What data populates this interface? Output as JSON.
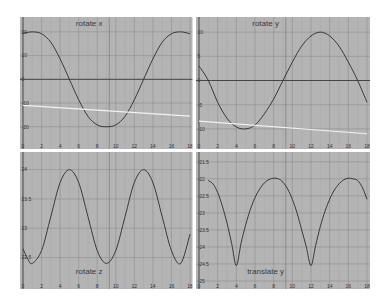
{
  "colors": {
    "panel_bg": "#b4b4b4",
    "grid_major": "#8f8f8f",
    "grid_minor": "#a6a6a6",
    "zero_line": "#3c3c3c",
    "curve": "#2b2b2b",
    "reference_line": "#f2f2f2",
    "divider": "#ffffff"
  },
  "chart_data": [
    {
      "type": "line",
      "title": "rotate x",
      "xlabel": "",
      "ylabel": "",
      "xlim": [
        0,
        18
      ],
      "ylim": [
        -26,
        25
      ],
      "xticks": [
        0,
        2,
        4,
        6,
        8,
        10,
        12,
        14,
        16,
        18
      ],
      "xtick_labels": [
        "0",
        "2",
        "4",
        "6",
        "8",
        "10",
        "12",
        "14",
        "16",
        "18"
      ],
      "yticks": [
        20,
        10,
        0,
        -10,
        -20
      ],
      "ytick_labels": [
        "20",
        "10",
        "0",
        "-10",
        "-20"
      ],
      "grid": true,
      "title_position": "top-center",
      "series": [
        {
          "name": "rotate x curve",
          "x": [
            0,
            1,
            2,
            3,
            4,
            5,
            6,
            7,
            8,
            9,
            10,
            11,
            12,
            13,
            14,
            15,
            16,
            17,
            18
          ],
          "y": [
            19.4,
            20,
            19.2,
            15.6,
            8.6,
            0,
            -8.6,
            -15.6,
            -19.2,
            -20,
            -19.2,
            -15.6,
            -8.6,
            0,
            8.6,
            15.6,
            19.2,
            20,
            19.2
          ]
        },
        {
          "name": "reference line",
          "x": [
            0,
            18
          ],
          "y": [
            -11,
            -15.5
          ]
        }
      ],
      "horizontal_lines": [
        0
      ]
    },
    {
      "type": "line",
      "title": "rotate y",
      "xlabel": "",
      "ylabel": "",
      "xlim": [
        0,
        18
      ],
      "ylim": [
        -12.5,
        12.5
      ],
      "xticks": [
        0,
        2,
        4,
        6,
        8,
        10,
        12,
        14,
        16,
        18
      ],
      "xtick_labels": [
        "0",
        "2",
        "4",
        "6",
        "8",
        "10",
        "12",
        "14",
        "16",
        "18"
      ],
      "yticks": [
        10,
        5,
        0,
        -5,
        -10
      ],
      "ytick_labels": [
        "10",
        "5",
        "0",
        "-5",
        "-10"
      ],
      "grid": true,
      "title_position": "top-center",
      "series": [
        {
          "name": "rotate y curve",
          "x": [
            0,
            1,
            2,
            3,
            4,
            5,
            6,
            7,
            8,
            9,
            10,
            11,
            12,
            13,
            14,
            15,
            16,
            17,
            18
          ],
          "y": [
            3,
            0,
            -4.5,
            -7.8,
            -9.6,
            -10,
            -9.2,
            -6.9,
            -3.8,
            0,
            3.8,
            7.1,
            9.2,
            10,
            9.2,
            7.1,
            3.8,
            0,
            -4.5
          ]
        },
        {
          "name": "reference line",
          "x": [
            0,
            18
          ],
          "y": [
            -8.4,
            -11
          ]
        }
      ],
      "horizontal_lines": [
        0
      ]
    },
    {
      "type": "line",
      "title": "rotate z",
      "xlabel": "",
      "ylabel": "",
      "xlim": [
        0,
        18
      ],
      "ylim": [
        22.1,
        24.25
      ],
      "xticks": [
        0,
        2,
        4,
        6,
        8,
        10,
        12,
        14,
        16,
        18
      ],
      "xtick_labels": [
        "0",
        "2",
        "4",
        "6",
        "8",
        "10",
        "12",
        "14",
        "16",
        "18"
      ],
      "yticks": [
        24,
        23.5,
        23,
        22.5
      ],
      "ytick_labels": [
        "24",
        "23.5",
        "23",
        "22.5"
      ],
      "grid": true,
      "title_position": "bottom-center",
      "series": [
        {
          "name": "rotate z curve",
          "x": [
            0,
            0.5,
            1,
            2,
            3,
            4,
            5,
            6,
            7,
            8,
            9,
            10,
            11,
            12,
            13,
            14,
            15,
            16,
            17,
            18
          ],
          "y": [
            22.65,
            22.48,
            22.4,
            22.62,
            23.2,
            23.78,
            24.0,
            23.78,
            23.2,
            22.62,
            22.4,
            22.62,
            23.2,
            23.78,
            24.0,
            23.78,
            23.2,
            22.62,
            22.4,
            22.9
          ]
        }
      ]
    },
    {
      "type": "line",
      "title": "translate y",
      "xlabel": "",
      "ylabel": "",
      "xlim": [
        0,
        18
      ],
      "ylim": [
        -25,
        -21.3
      ],
      "xticks": [
        0,
        2,
        4,
        6,
        8,
        10,
        12,
        14,
        16,
        18
      ],
      "xtick_labels": [
        "0",
        "2",
        "4",
        "6",
        "8",
        "10",
        "12",
        "14",
        "16",
        "18"
      ],
      "yticks": [
        -21.5,
        -22,
        -22.5,
        -23,
        -23.5,
        -24,
        -24.5,
        -25
      ],
      "ytick_labels": [
        "-21.5",
        "-22",
        "-22.5",
        "-23",
        "-23.5",
        "-24",
        "-24.5",
        "-25"
      ],
      "grid": true,
      "title_position": "bottom-center",
      "series": [
        {
          "name": "translate y curve",
          "x": [
            1,
            1.5,
            2,
            2.5,
            3,
            3.5,
            4,
            4.5,
            5,
            5.5,
            6,
            6.5,
            7,
            7.5,
            8,
            8.5,
            9,
            9.5,
            10,
            10.5,
            11,
            11.5,
            12,
            12.5,
            13,
            13.5,
            14,
            14.5,
            15,
            15.5,
            16,
            16.5,
            17,
            17.5,
            18
          ],
          "y": [
            -22.05,
            -22.15,
            -22.4,
            -22.8,
            -23.3,
            -23.9,
            -24.55,
            -23.9,
            -23.35,
            -22.9,
            -22.55,
            -22.3,
            -22.12,
            -22.02,
            -21.98,
            -22.0,
            -22.1,
            -22.3,
            -22.6,
            -23.0,
            -23.5,
            -24.0,
            -24.55,
            -23.95,
            -23.4,
            -22.95,
            -22.6,
            -22.33,
            -22.15,
            -22.03,
            -21.98,
            -22.0,
            -22.05,
            -22.25,
            -22.6
          ]
        }
      ]
    }
  ]
}
